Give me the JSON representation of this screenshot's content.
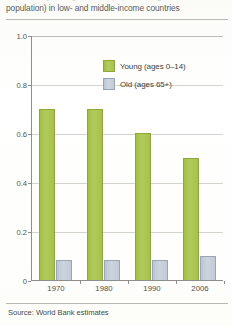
{
  "caption": {
    "cut_off_line": "dependency ratio (percent of population aged 0–14 and 65+ relative to working-age",
    "visible_line": "population) in low- and middle-income countries"
  },
  "legend": {
    "position": "inside-top-right",
    "items": [
      {
        "label": "Young (ages 0–14)",
        "color": "#a6c249"
      },
      {
        "label": "Old (ages 65+)",
        "color": "#c1cad6"
      }
    ]
  },
  "source": {
    "text": "Source: World Bank estimates"
  },
  "chart_data": {
    "type": "bar",
    "title": "",
    "subtitle": "",
    "xlabel": "",
    "ylabel": "",
    "categories": [
      "1970",
      "1980",
      "1990",
      "2006"
    ],
    "series": [
      {
        "name": "Young (ages 0–14)",
        "color": "#a6c249",
        "values": [
          0.7,
          0.7,
          0.6,
          0.5
        ]
      },
      {
        "name": "Old (ages 65+)",
        "color": "#c1cad6",
        "values": [
          0.08,
          0.08,
          0.08,
          0.1
        ]
      }
    ],
    "ylim": [
      0,
      1.0
    ],
    "yticks": [
      "0",
      "0.2",
      "0.4",
      "0.6",
      "0.8",
      "1.0"
    ],
    "ytick_values": [
      0,
      0.2,
      0.4,
      0.6,
      0.8,
      1.0
    ],
    "grid": true,
    "grid_axis": "y",
    "legend_position": "inside top right"
  }
}
